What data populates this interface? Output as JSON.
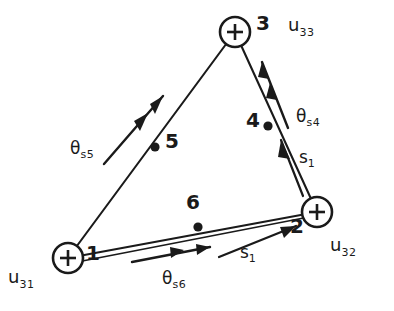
{
  "figure": {
    "ink_color": "#1a1a1a",
    "background_color": "#ffffff"
  },
  "nodes": [
    {
      "id": "1",
      "label": "1",
      "type": "support-node",
      "marker": "circle-plus",
      "cx": 68,
      "cy": 258,
      "r": 15,
      "label_x": 88,
      "label_y": 250
    },
    {
      "id": "2",
      "label": "2",
      "type": "support-node",
      "marker": "circle-plus",
      "cx": 317,
      "cy": 212,
      "r": 15,
      "label_x": 292,
      "label_y": 222
    },
    {
      "id": "3",
      "label": "3",
      "type": "support-node",
      "marker": "circle-plus",
      "cx": 235,
      "cy": 32,
      "r": 15,
      "label_x": 255,
      "label_y": 17
    },
    {
      "id": "4",
      "label": "4",
      "type": "mid-node",
      "marker": "dot",
      "cx": 268,
      "cy": 126,
      "r": 4,
      "label_x": 248,
      "label_y": 116
    },
    {
      "id": "5",
      "label": "5",
      "type": "mid-node",
      "marker": "dot",
      "cx": 155,
      "cy": 147,
      "r": 4,
      "label_x": 164,
      "label_y": 136
    },
    {
      "id": "6",
      "label": "6",
      "type": "mid-node",
      "marker": "dot",
      "cx": 198,
      "cy": 227,
      "r": 4,
      "label_x": 188,
      "label_y": 196
    }
  ],
  "edges": [
    {
      "name": "edge-1-3",
      "x1": 68,
      "y1": 258,
      "x2": 235,
      "y2": 32
    },
    {
      "name": "edge-3-2",
      "x1": 235,
      "y1": 32,
      "x2": 317,
      "y2": 212
    },
    {
      "name": "edge-1-2",
      "x1": 68,
      "y1": 258,
      "x2": 317,
      "y2": 212
    },
    {
      "name": "edge-1-2-lower",
      "x1": 70,
      "y1": 262,
      "x2": 315,
      "y2": 215
    }
  ],
  "displacement_labels": [
    {
      "name": "u31",
      "base": "u",
      "sub": "31",
      "x": 8,
      "y": 276
    },
    {
      "name": "u32",
      "base": "u",
      "sub": "32",
      "x": 330,
      "y": 244
    },
    {
      "name": "u33",
      "base": "u",
      "sub": "33",
      "x": 288,
      "y": 22
    }
  ],
  "rotation_labels": [
    {
      "name": "theta-s5",
      "base": "θ",
      "sub": "s5",
      "x": 70,
      "y": 146
    },
    {
      "name": "theta-s4",
      "base": "θ",
      "sub": "s4",
      "x": 296,
      "y": 113
    },
    {
      "name": "theta-s6",
      "base": "θ",
      "sub": "s6",
      "x": 162,
      "y": 276
    }
  ],
  "force_labels": [
    {
      "name": "s1-edge-32",
      "base": "s",
      "sub": "1",
      "x": 299,
      "y": 155
    },
    {
      "name": "s1-edge-12",
      "base": "s",
      "sub": "1",
      "x": 240,
      "y": 250
    }
  ],
  "rotation_arrows": [
    {
      "name": "rotation-arrow-theta-s5",
      "x1": 108,
      "y1": 160,
      "x2": 160,
      "y2": 100,
      "heads": 2
    },
    {
      "name": "rotation-arrow-theta-s4",
      "x1": 285,
      "y1": 122,
      "x2": 262,
      "y2": 65,
      "heads": 2
    },
    {
      "name": "rotation-arrow-theta-s6",
      "x1": 136,
      "y1": 260,
      "x2": 205,
      "y2": 249,
      "heads": 2
    }
  ],
  "force_arrows": [
    {
      "name": "force-arrow-s1-edge-32",
      "x1": 300,
      "y1": 190,
      "x2": 282,
      "y2": 143,
      "heads": 1
    },
    {
      "name": "force-arrow-s1-edge-12",
      "x1": 222,
      "y1": 255,
      "x2": 292,
      "y2": 228,
      "heads": 1
    }
  ]
}
